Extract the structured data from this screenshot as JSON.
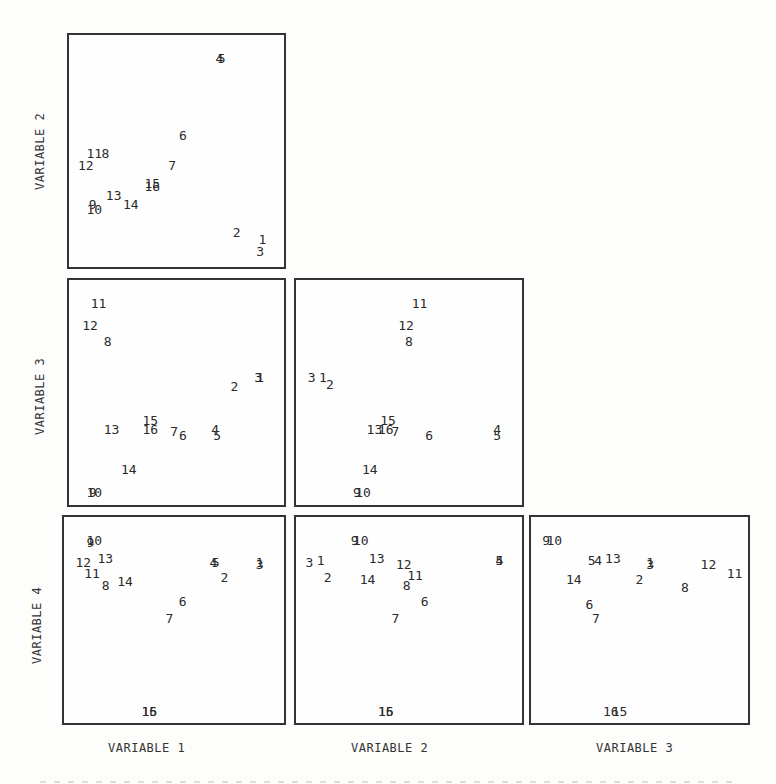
{
  "chart_data": {
    "type": "scatter",
    "title": "",
    "layout": "scatterplot-matrix (lower triangle)",
    "grid": false,
    "variables": [
      "VARIABLE 1",
      "VARIABLE 2",
      "VARIABLE 3",
      "VARIABLE 4"
    ],
    "row_labels": [
      "VARIABLE 2",
      "VARIABLE 3",
      "VARIABLE 4"
    ],
    "col_labels": [
      "VARIABLE 1",
      "VARIABLE 2",
      "VARIABLE 3"
    ],
    "note": "Points plotted as observation-number labels (1-16); coordinates are relative positions in panel (0-1, y up).",
    "panels": [
      {
        "x": "VARIABLE 1",
        "y": "VARIABLE 2",
        "points": [
          {
            "label": "1",
            "x": 0.9,
            "y": 0.12
          },
          {
            "label": "2",
            "x": 0.78,
            "y": 0.15
          },
          {
            "label": "3",
            "x": 0.89,
            "y": 0.07
          },
          {
            "label": "4",
            "x": 0.7,
            "y": 0.9
          },
          {
            "label": "5",
            "x": 0.71,
            "y": 0.9
          },
          {
            "label": "6",
            "x": 0.53,
            "y": 0.57
          },
          {
            "label": "7",
            "x": 0.48,
            "y": 0.44
          },
          {
            "label": "8",
            "x": 0.17,
            "y": 0.49
          },
          {
            "label": "9",
            "x": 0.11,
            "y": 0.27
          },
          {
            "label": "10",
            "x": 0.1,
            "y": 0.25
          },
          {
            "label": "11",
            "x": 0.1,
            "y": 0.49
          },
          {
            "label": "12",
            "x": 0.06,
            "y": 0.44
          },
          {
            "label": "13",
            "x": 0.19,
            "y": 0.31
          },
          {
            "label": "14",
            "x": 0.27,
            "y": 0.27
          },
          {
            "label": "15",
            "x": 0.37,
            "y": 0.36
          },
          {
            "label": "16",
            "x": 0.37,
            "y": 0.35
          }
        ]
      },
      {
        "x": "VARIABLE 1",
        "y": "VARIABLE 3",
        "points": [
          {
            "label": "1",
            "x": 0.89,
            "y": 0.57
          },
          {
            "label": "2",
            "x": 0.77,
            "y": 0.53
          },
          {
            "label": "3",
            "x": 0.88,
            "y": 0.57
          },
          {
            "label": "4",
            "x": 0.68,
            "y": 0.34
          },
          {
            "label": "5",
            "x": 0.69,
            "y": 0.31
          },
          {
            "label": "6",
            "x": 0.53,
            "y": 0.31
          },
          {
            "label": "7",
            "x": 0.49,
            "y": 0.33
          },
          {
            "label": "8",
            "x": 0.18,
            "y": 0.73
          },
          {
            "label": "9",
            "x": 0.11,
            "y": 0.06
          },
          {
            "label": "10",
            "x": 0.1,
            "y": 0.06
          },
          {
            "label": "11",
            "x": 0.12,
            "y": 0.9
          },
          {
            "label": "12",
            "x": 0.08,
            "y": 0.8
          },
          {
            "label": "13",
            "x": 0.18,
            "y": 0.34
          },
          {
            "label": "14",
            "x": 0.26,
            "y": 0.16
          },
          {
            "label": "15",
            "x": 0.36,
            "y": 0.38
          },
          {
            "label": "16",
            "x": 0.36,
            "y": 0.34
          }
        ]
      },
      {
        "x": "VARIABLE 2",
        "y": "VARIABLE 3",
        "points": [
          {
            "label": "1",
            "x": 0.12,
            "y": 0.57
          },
          {
            "label": "2",
            "x": 0.15,
            "y": 0.54
          },
          {
            "label": "3",
            "x": 0.07,
            "y": 0.57
          },
          {
            "label": "4",
            "x": 0.89,
            "y": 0.34
          },
          {
            "label": "5",
            "x": 0.89,
            "y": 0.31
          },
          {
            "label": "6",
            "x": 0.59,
            "y": 0.31
          },
          {
            "label": "7",
            "x": 0.44,
            "y": 0.33
          },
          {
            "label": "8",
            "x": 0.5,
            "y": 0.73
          },
          {
            "label": "9",
            "x": 0.27,
            "y": 0.06
          },
          {
            "label": "10",
            "x": 0.28,
            "y": 0.06
          },
          {
            "label": "11",
            "x": 0.53,
            "y": 0.9
          },
          {
            "label": "12",
            "x": 0.47,
            "y": 0.8
          },
          {
            "label": "13",
            "x": 0.33,
            "y": 0.34
          },
          {
            "label": "14",
            "x": 0.31,
            "y": 0.16
          },
          {
            "label": "15",
            "x": 0.39,
            "y": 0.38
          },
          {
            "label": "16",
            "x": 0.38,
            "y": 0.34
          }
        ]
      },
      {
        "x": "VARIABLE 1",
        "y": "VARIABLE 4",
        "points": [
          {
            "label": "1",
            "x": 0.89,
            "y": 0.78
          },
          {
            "label": "2",
            "x": 0.73,
            "y": 0.71
          },
          {
            "label": "3",
            "x": 0.89,
            "y": 0.77
          },
          {
            "label": "4",
            "x": 0.68,
            "y": 0.78
          },
          {
            "label": "5",
            "x": 0.69,
            "y": 0.78
          },
          {
            "label": "6",
            "x": 0.54,
            "y": 0.59
          },
          {
            "label": "7",
            "x": 0.48,
            "y": 0.51
          },
          {
            "label": "8",
            "x": 0.19,
            "y": 0.67
          },
          {
            "label": "9",
            "x": 0.12,
            "y": 0.88
          },
          {
            "label": "10",
            "x": 0.12,
            "y": 0.89
          },
          {
            "label": "11",
            "x": 0.11,
            "y": 0.73
          },
          {
            "label": "12",
            "x": 0.07,
            "y": 0.78
          },
          {
            "label": "13",
            "x": 0.17,
            "y": 0.8
          },
          {
            "label": "14",
            "x": 0.26,
            "y": 0.69
          },
          {
            "label": "15",
            "x": 0.37,
            "y": 0.06
          },
          {
            "label": "16",
            "x": 0.37,
            "y": 0.06
          }
        ]
      },
      {
        "x": "VARIABLE 2",
        "y": "VARIABLE 4",
        "points": [
          {
            "label": "1",
            "x": 0.11,
            "y": 0.79
          },
          {
            "label": "2",
            "x": 0.14,
            "y": 0.71
          },
          {
            "label": "3",
            "x": 0.06,
            "y": 0.78
          },
          {
            "label": "4",
            "x": 0.9,
            "y": 0.79
          },
          {
            "label": "5",
            "x": 0.9,
            "y": 0.79
          },
          {
            "label": "6",
            "x": 0.57,
            "y": 0.59
          },
          {
            "label": "7",
            "x": 0.44,
            "y": 0.51
          },
          {
            "label": "8",
            "x": 0.49,
            "y": 0.67
          },
          {
            "label": "9",
            "x": 0.26,
            "y": 0.89
          },
          {
            "label": "10",
            "x": 0.27,
            "y": 0.89
          },
          {
            "label": "11",
            "x": 0.51,
            "y": 0.72
          },
          {
            "label": "12",
            "x": 0.46,
            "y": 0.77
          },
          {
            "label": "13",
            "x": 0.34,
            "y": 0.8
          },
          {
            "label": "14",
            "x": 0.3,
            "y": 0.7
          },
          {
            "label": "15",
            "x": 0.38,
            "y": 0.06
          },
          {
            "label": "16",
            "x": 0.38,
            "y": 0.06
          }
        ]
      },
      {
        "x": "VARIABLE 3",
        "y": "VARIABLE 4",
        "points": [
          {
            "label": "1",
            "x": 0.55,
            "y": 0.78
          },
          {
            "label": "2",
            "x": 0.5,
            "y": 0.7
          },
          {
            "label": "3",
            "x": 0.55,
            "y": 0.77
          },
          {
            "label": "4",
            "x": 0.31,
            "y": 0.79
          },
          {
            "label": "5",
            "x": 0.28,
            "y": 0.79
          },
          {
            "label": "6",
            "x": 0.27,
            "y": 0.58
          },
          {
            "label": "7",
            "x": 0.3,
            "y": 0.51
          },
          {
            "label": "8",
            "x": 0.71,
            "y": 0.66
          },
          {
            "label": "9",
            "x": 0.07,
            "y": 0.89
          },
          {
            "label": "10",
            "x": 0.09,
            "y": 0.89
          },
          {
            "label": "11",
            "x": 0.92,
            "y": 0.73
          },
          {
            "label": "12",
            "x": 0.8,
            "y": 0.77
          },
          {
            "label": "13",
            "x": 0.36,
            "y": 0.8
          },
          {
            "label": "14",
            "x": 0.18,
            "y": 0.7
          },
          {
            "label": "15",
            "x": 0.39,
            "y": 0.06
          },
          {
            "label": "16",
            "x": 0.35,
            "y": 0.06
          }
        ]
      }
    ]
  },
  "labels": {
    "row": [
      "VARIABLE 2",
      "VARIABLE 3",
      "VARIABLE 4"
    ],
    "col": [
      "VARIABLE 1",
      "VARIABLE 2",
      "VARIABLE 3"
    ]
  }
}
